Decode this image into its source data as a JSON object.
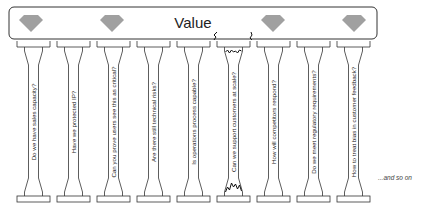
{
  "roof": {
    "label": "Value",
    "gem_color": "#a0a0a0",
    "gem_count": 4
  },
  "pillars": [
    {
      "question": "Do we have sales capacity?",
      "cracked": false
    },
    {
      "question": "Have we protected IP?",
      "cracked": false
    },
    {
      "question": "Can you prove users see this as critical?",
      "cracked": false
    },
    {
      "question": "Are there still technical risks?",
      "cracked": false
    },
    {
      "question": "Is operations process capable?",
      "cracked": false
    },
    {
      "question": "Can we support customers at scale?",
      "cracked": true
    },
    {
      "question": "How will competitors respond?",
      "cracked": false
    },
    {
      "question": "Do we  meet regulatory requirements?",
      "cracked": false
    },
    {
      "question": "How to treat bias in customer feedback?",
      "cracked": false
    }
  ],
  "footer_note": "...and so on",
  "colors": {
    "stroke": "#333333",
    "crack": "#111111"
  }
}
